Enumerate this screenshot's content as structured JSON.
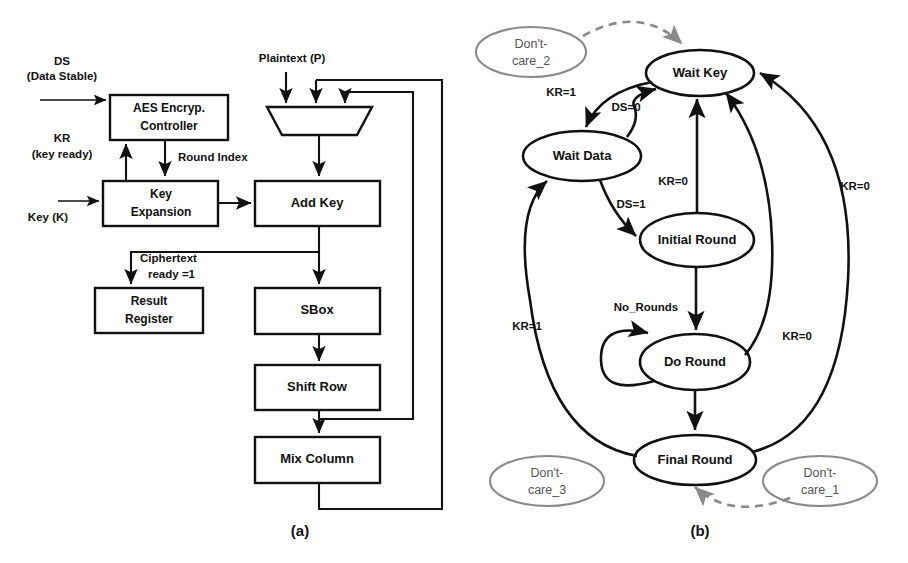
{
  "figure": {
    "caption_a": "(a)",
    "caption_b": "(b)"
  },
  "block_diagram": {
    "title_hint": "AES Encryption Datapath and Controller",
    "blocks": [
      {
        "id": "controller",
        "label_line1": "AES Encryp.",
        "label_line2": "Controller"
      },
      {
        "id": "key_expansion",
        "label_line1": "Key",
        "label_line2": "Expansion"
      },
      {
        "id": "add_key",
        "label_line1": "Add Key",
        "label_line2": ""
      },
      {
        "id": "result_register",
        "label_line1": "Result",
        "label_line2": "Register"
      },
      {
        "id": "sbox",
        "label_line1": "SBox",
        "label_line2": ""
      },
      {
        "id": "shift_row",
        "label_line1": "Shift Row",
        "label_line2": ""
      },
      {
        "id": "mix_column",
        "label_line1": "Mix Column",
        "label_line2": ""
      },
      {
        "id": "mux",
        "label_line1": "",
        "label_line2": ""
      }
    ],
    "signals": [
      {
        "id": "ds",
        "line1": "DS",
        "line2": "(Data Stable)"
      },
      {
        "id": "kr",
        "line1": "KR",
        "line2": "(key ready)"
      },
      {
        "id": "key",
        "line1": "Key (K)",
        "line2": ""
      },
      {
        "id": "round_index",
        "line1": "Round Index",
        "line2": ""
      },
      {
        "id": "plaintext",
        "line1": "Plaintext (P)",
        "line2": ""
      },
      {
        "id": "ciphertext_ready",
        "line1": "Ciphertext",
        "line2": "ready =1"
      }
    ]
  },
  "state_machine": {
    "states": [
      {
        "id": "wait_key",
        "label": "Wait Key"
      },
      {
        "id": "wait_data",
        "label": "Wait Data"
      },
      {
        "id": "initial_round",
        "label": "Initial Round"
      },
      {
        "id": "do_round",
        "label": "Do Round"
      },
      {
        "id": "final_round",
        "label": "Final Round"
      }
    ],
    "dont_care_states": [
      {
        "id": "dont_care_2",
        "line1": "Don't-",
        "line2": "care_2"
      },
      {
        "id": "dont_care_3",
        "line1": "Don't-",
        "line2": "care_3"
      },
      {
        "id": "dont_care_1",
        "line1": "Don't-",
        "line2": "care_1"
      }
    ],
    "transitions": [
      {
        "id": "t_waitkey_waitdata",
        "from": "wait_key",
        "to": "wait_data",
        "label": "KR=1"
      },
      {
        "id": "t_waitdata_waitkey",
        "from": "wait_data",
        "to": "wait_key",
        "label": "DS=0"
      },
      {
        "id": "t_waitdata_initial",
        "from": "wait_data",
        "to": "initial_round",
        "label": "DS=1"
      },
      {
        "id": "t_initial_waitkey",
        "from": "initial_round",
        "to": "wait_key",
        "label": "KR=0"
      },
      {
        "id": "t_doround_waitkey",
        "from": "do_round",
        "to": "wait_key",
        "label": "KR=0"
      },
      {
        "id": "t_finalround_waitkey",
        "from": "final_round",
        "to": "wait_key",
        "label": "KR=0"
      },
      {
        "id": "t_doround_self",
        "from": "do_round",
        "to": "do_round",
        "label": "No_Rounds"
      },
      {
        "id": "t_finalround_waitdata",
        "from": "final_round",
        "to": "wait_data",
        "label": "KR=1"
      },
      {
        "id": "t_initial_doround",
        "from": "initial_round",
        "to": "do_round",
        "label": ""
      },
      {
        "id": "t_doround_finalround",
        "from": "do_round",
        "to": "final_round",
        "label": ""
      },
      {
        "id": "t_dc2_waitkey",
        "from": "dont_care_2",
        "to": "wait_key",
        "label": "",
        "style": "dashed"
      },
      {
        "id": "t_dc1_finalround",
        "from": "dont_care_1",
        "to": "final_round",
        "label": "",
        "style": "dashed"
      }
    ]
  },
  "colors": {
    "stroke": "#111111",
    "gray_stroke": "#8a8a8a",
    "background": "#ffffff"
  }
}
